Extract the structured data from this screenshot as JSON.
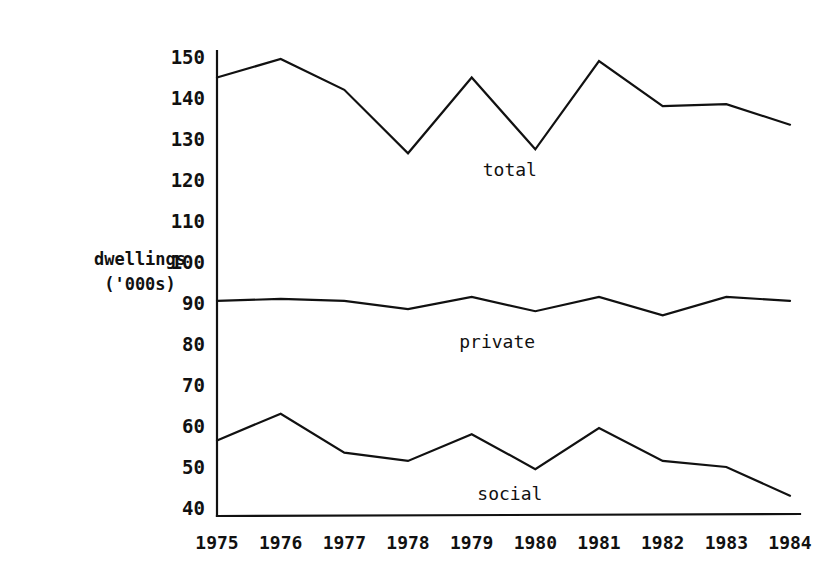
{
  "chart_data": {
    "type": "line",
    "title": "",
    "xlabel": "",
    "ylabel": "dwellings ('000s)",
    "ylabel_line1": "dwellings",
    "ylabel_line2": "('000s)",
    "categories": [
      "1975",
      "1976",
      "1977",
      "1978",
      "1979",
      "1980",
      "1981",
      "1982",
      "1983",
      "1984"
    ],
    "x": [
      1975,
      1976,
      1977,
      1978,
      1979,
      1980,
      1981,
      1982,
      1983,
      1984
    ],
    "ylim": [
      35,
      153
    ],
    "xlim": [
      1974.7,
      1984.3
    ],
    "yticks": [
      40,
      50,
      60,
      70,
      80,
      90,
      100,
      110,
      120,
      130,
      140,
      150
    ],
    "ytick_labels": [
      "40",
      "50",
      "60",
      "70",
      "80",
      "90",
      "100",
      "110",
      "120",
      "130",
      "140",
      "150"
    ],
    "grid": false,
    "legend_position": "inline-annotations",
    "series": [
      {
        "name": "total",
        "label": "total",
        "color": "#111111",
        "values": [
          145,
          149.5,
          142,
          126.5,
          145,
          127.5,
          149,
          138,
          138.5,
          133.5
        ],
        "annotation": {
          "text": "total",
          "x": 1979.6,
          "y": 121
        }
      },
      {
        "name": "private",
        "label": "private",
        "color": "#111111",
        "values": [
          90.5,
          91,
          90.5,
          88.5,
          91.5,
          88,
          91.5,
          87,
          91.5,
          90.5
        ],
        "annotation": {
          "text": "private",
          "x": 1979.4,
          "y": 79
        }
      },
      {
        "name": "social",
        "label": "social",
        "color": "#111111",
        "values": [
          56.5,
          63,
          53.5,
          51.5,
          58,
          49.5,
          59.5,
          51.5,
          50,
          43
        ],
        "annotation": {
          "text": "social",
          "x": 1979.6,
          "y": 42
        }
      }
    ]
  },
  "axes": {
    "y_axis_name": "vertical-axis",
    "x_axis_name": "horizontal-axis"
  }
}
